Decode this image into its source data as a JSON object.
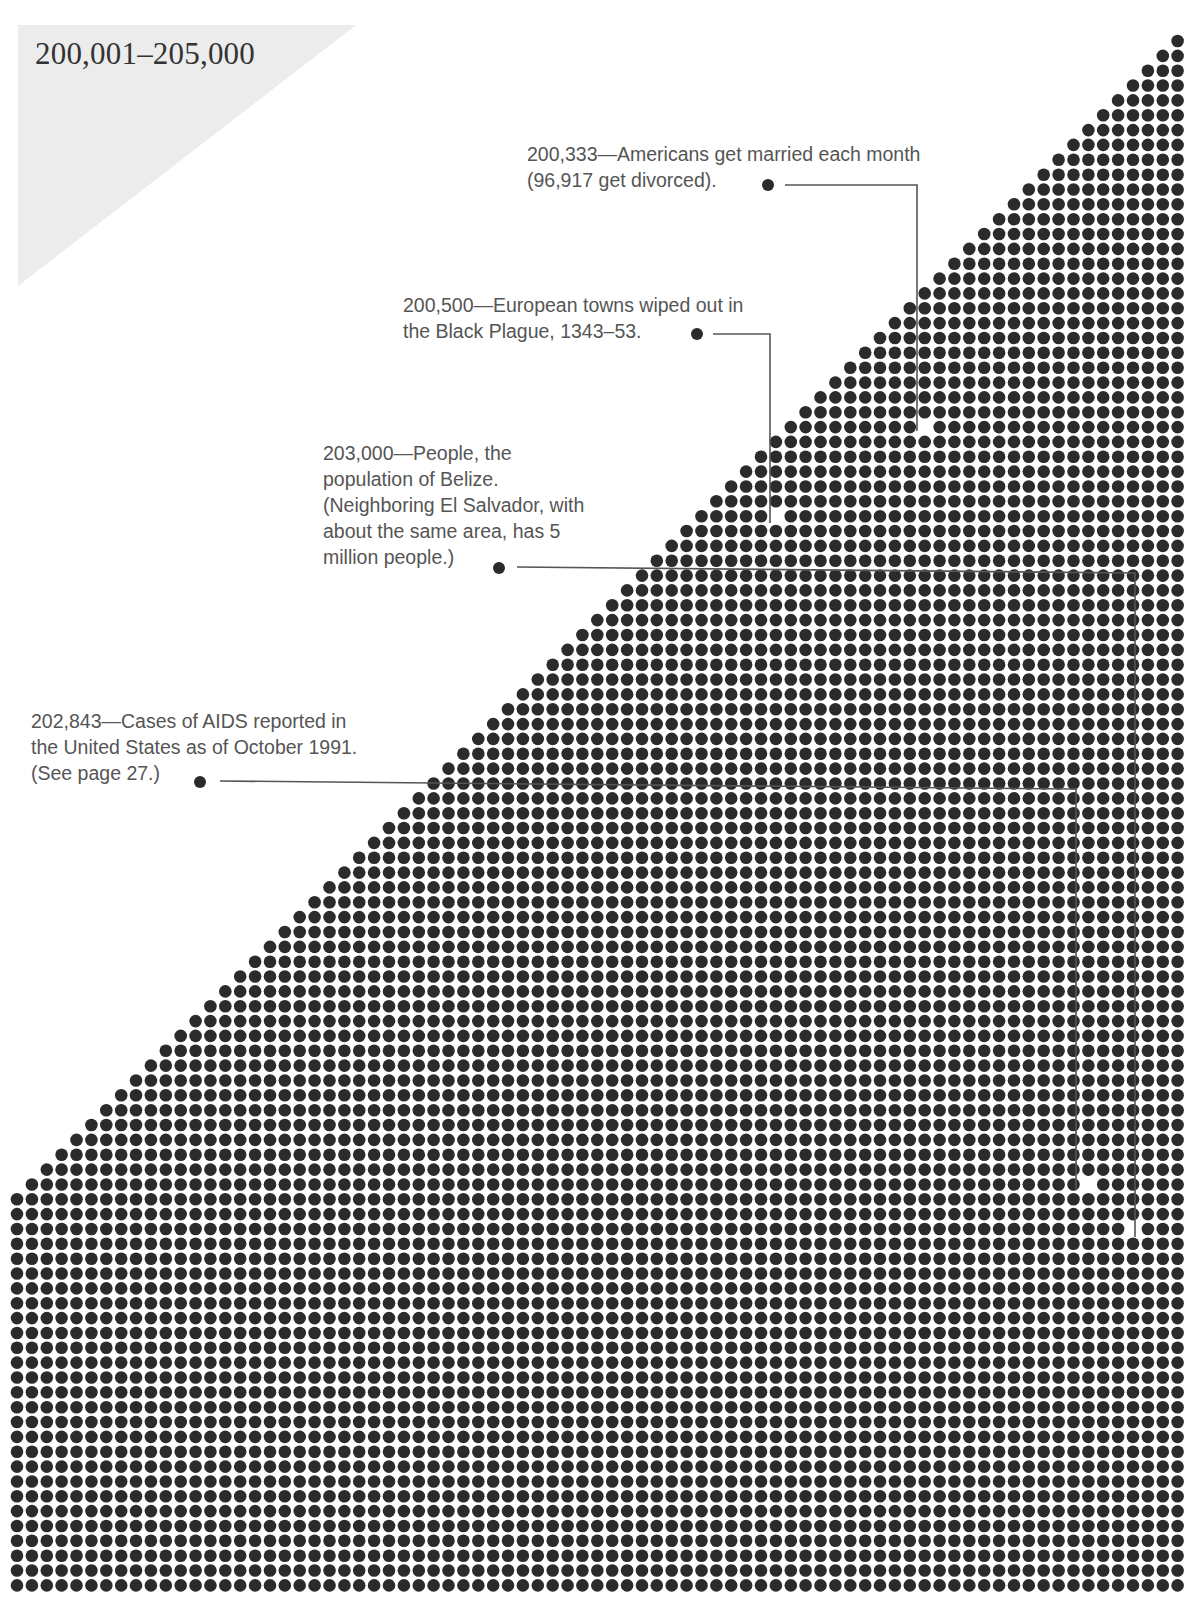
{
  "header": {
    "range_label": "200,001–205,000"
  },
  "colors": {
    "dot": "#2b2b2b",
    "highlight_dot": "#ffffff",
    "leader_line": "#555555",
    "triangle": "#ececec",
    "text": "#555555"
  },
  "grid": {
    "columns": 79,
    "rows": 105,
    "first_col_x": 17,
    "first_row_y": 41,
    "pitch_x": 14.88,
    "pitch_y": 14.85,
    "dot_radius": 6.3,
    "staircase_anchor_col": 78
  },
  "annotations": [
    {
      "id": "married",
      "value": "200,333",
      "lines": [
        "200,333—Americans get married each month",
        "(96,917 get divorced)."
      ],
      "text_x": 527,
      "text_y": 141,
      "bullet": [
        768,
        185
      ],
      "path": [
        [
          785,
          185
        ],
        [
          917,
          185
        ],
        [
          917,
          431
        ]
      ],
      "highlight": [
        924,
        423
      ]
    },
    {
      "id": "black-plague",
      "value": "200,500",
      "lines": [
        "200,500—European towns wiped out in",
        "the Black Plague, 1343–53."
      ],
      "text_x": 403,
      "text_y": 292,
      "bullet": [
        697,
        334
      ],
      "path": [
        [
          713,
          334
        ],
        [
          770,
          334
        ],
        [
          770,
          523
        ]
      ],
      "highlight": [
        777,
        513
      ]
    },
    {
      "id": "belize",
      "value": "203,000",
      "lines": [
        "203,000—People, the",
        "population of Belize.",
        "(Neighboring El Salvador, with",
        "about the same area, has 5",
        "million people.)"
      ],
      "text_x": 323,
      "text_y": 440,
      "bullet": [
        499,
        568
      ],
      "path": [
        [
          517,
          567
        ],
        [
          1135,
          573
        ],
        [
          1135,
          1237
        ]
      ],
      "highlight": [
        1139,
        1226
      ]
    },
    {
      "id": "aids",
      "value": "202,843",
      "lines": [
        "202,843—Cases of AIDS reported in",
        "the United States as of October 1991.",
        "(See page 27.)"
      ],
      "text_x": 31,
      "text_y": 708,
      "bullet": [
        200,
        782
      ],
      "path": [
        [
          220,
          781
        ],
        [
          1076,
          789
        ],
        [
          1076,
          1190
        ]
      ],
      "highlight": [
        1081,
        1182
      ]
    }
  ],
  "chart_data": {
    "type": "dot-grid",
    "title": "200,001–205,000",
    "range": [
      200001,
      205000
    ],
    "highlighted_values": [
      {
        "value": 200333,
        "label": "Americans get married each month (96,917 get divorced)."
      },
      {
        "value": 200500,
        "label": "European towns wiped out in the Black Plague, 1343–53."
      },
      {
        "value": 202843,
        "label": "Cases of AIDS reported in the United States as of October 1991. (See page 27.)"
      },
      {
        "value": 203000,
        "label": "People, the population of Belize. (Neighboring El Salvador, with about the same area, has 5 million people.)"
      }
    ]
  }
}
